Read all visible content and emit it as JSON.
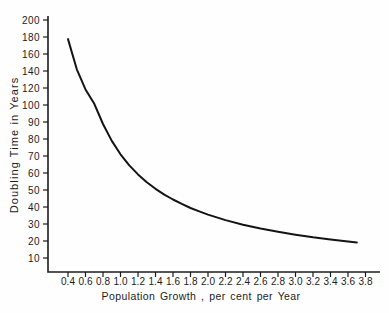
{
  "chart_data": {
    "type": "line",
    "title": "",
    "xlabel": "Population Growth , per cent per Year",
    "ylabel": "Doubling Time in Years",
    "x_tick_labels": [
      "0.4",
      "0.6",
      "0.8",
      "1.0",
      "1.2",
      "1.4",
      "1.6",
      "1.8",
      "2.0",
      "2.2",
      "2.4",
      "2.6",
      "2.8",
      "3.0",
      "3.2",
      "3.4",
      "3.6",
      "3.8"
    ],
    "y_tick_labels": [
      "200",
      "180",
      "160",
      "140",
      "120",
      "100",
      "90",
      "80",
      "70",
      "60",
      "50",
      "40",
      "30",
      "20",
      "10"
    ],
    "x_range": [
      0.4,
      3.8
    ],
    "y_axis_note": "non-uniform scale: equal tick spacing, 20-unit steps from 100 to 200, 10-unit steps from 10 to 100",
    "grid": false,
    "legend": "none",
    "series": [
      {
        "name": "doubling-time-curve",
        "points": [
          [
            0.4,
            177.5
          ],
          [
            0.5,
            142.0
          ],
          [
            0.6,
            118.3
          ],
          [
            0.7,
            101.4
          ],
          [
            0.8,
            88.8
          ],
          [
            0.9,
            78.9
          ],
          [
            1.0,
            71.0
          ],
          [
            1.1,
            64.5
          ],
          [
            1.2,
            59.2
          ],
          [
            1.3,
            54.6
          ],
          [
            1.4,
            50.7
          ],
          [
            1.5,
            47.3
          ],
          [
            1.6,
            44.4
          ],
          [
            1.7,
            41.8
          ],
          [
            1.8,
            39.4
          ],
          [
            1.9,
            37.4
          ],
          [
            2.0,
            35.5
          ],
          [
            2.2,
            32.3
          ],
          [
            2.4,
            29.6
          ],
          [
            2.6,
            27.3
          ],
          [
            2.8,
            25.4
          ],
          [
            3.0,
            23.7
          ],
          [
            3.2,
            22.2
          ],
          [
            3.4,
            20.9
          ],
          [
            3.6,
            19.7
          ],
          [
            3.7,
            19.2
          ]
        ]
      }
    ],
    "line_color": "#141414",
    "axis_color": "#1c1c1c",
    "background": "#fefefe"
  }
}
